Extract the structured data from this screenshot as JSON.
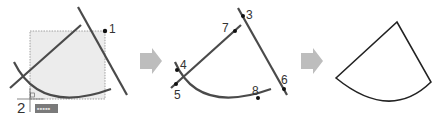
{
  "colors": {
    "line": "#4a4a4a",
    "selection_fill": "#ececec",
    "selection_border": "#8a8a8a",
    "arrow": "#bdbdbd",
    "tooltip_bg": "#7a7a7a",
    "result_outline": "#222222"
  },
  "steps": [
    {
      "name": "select-objects",
      "labels": [
        {
          "id": "1",
          "text": "1"
        },
        {
          "id": "2",
          "text": "2"
        }
      ],
      "tooltip": {
        "text": "■■■■■"
      }
    },
    {
      "name": "pick-segments",
      "labels": [
        {
          "id": "3",
          "text": "3"
        },
        {
          "id": "4",
          "text": "4"
        },
        {
          "id": "5",
          "text": "5"
        },
        {
          "id": "6",
          "text": "6"
        },
        {
          "id": "7",
          "text": "7"
        },
        {
          "id": "8",
          "text": "8"
        }
      ]
    },
    {
      "name": "result-sector"
    }
  ],
  "arrows": [
    {
      "icon": "right-arrow-icon"
    },
    {
      "icon": "right-arrow-icon"
    }
  ]
}
